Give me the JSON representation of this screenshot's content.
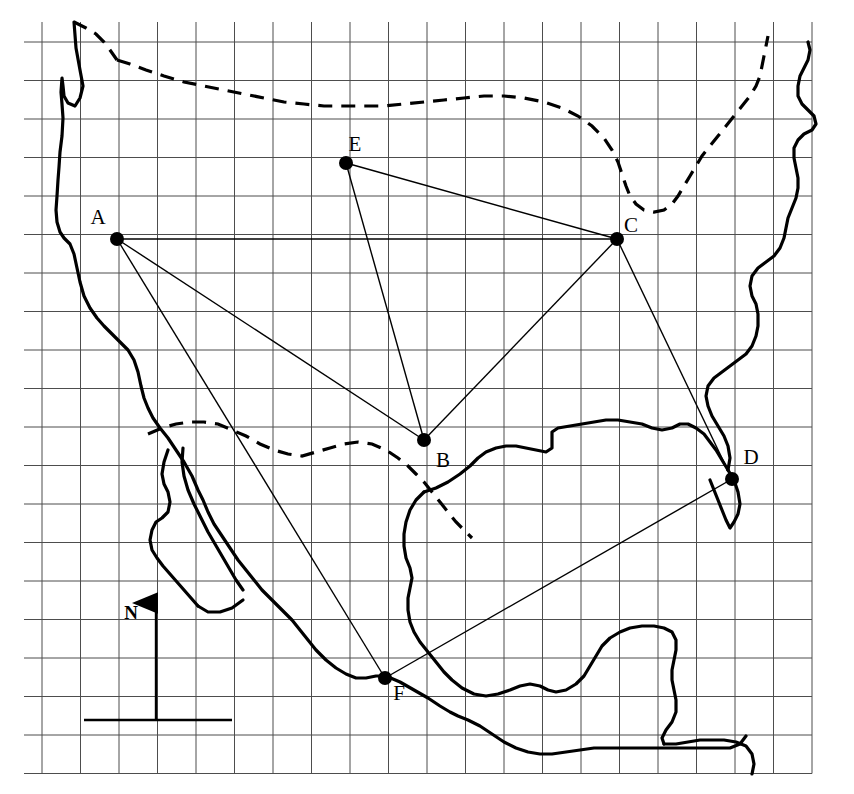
{
  "figure": {
    "kind": "reference-map",
    "title_partial": "",
    "width": 854,
    "height": 794,
    "background_color": "#ffffff",
    "ink_color": "#000000",
    "grid_color": "#555555"
  },
  "grid": {
    "label": "graticule",
    "x_start": 42,
    "y_start": 42,
    "spacing": 38.5,
    "cols": 20,
    "rows": 19,
    "line_color": "#4d4d4d",
    "line_width": 1
  },
  "coastline": {
    "name": "north-america-coastline",
    "style": "solid",
    "stroke_width": 3.2,
    "features": [
      "pacific-west-coast",
      "baja-california",
      "gulf-of-mexico",
      "yucatan-peninsula",
      "central-america",
      "florida-atlantic-coast",
      "northeast-atlantic-coast"
    ]
  },
  "borders": {
    "name": "political-borders",
    "style": "dashed",
    "stroke_width": 3.2,
    "dash_pattern": "14 9",
    "features": [
      "usa-canada-border-north",
      "usa-canada-border-east",
      "usa-mexico-border"
    ]
  },
  "points": [
    {
      "id": "A",
      "label": "A",
      "x": 117,
      "y": 239,
      "label_x": 98,
      "label_y": 224,
      "radius": 7
    },
    {
      "id": "B",
      "label": "B",
      "x": 424,
      "y": 440,
      "label_x": 443,
      "label_y": 467,
      "radius": 7
    },
    {
      "id": "C",
      "label": "C",
      "x": 617,
      "y": 239,
      "label_x": 631,
      "label_y": 232,
      "radius": 7
    },
    {
      "id": "D",
      "label": "D",
      "x": 732,
      "y": 479,
      "label_x": 751,
      "label_y": 464,
      "radius": 7
    },
    {
      "id": "E",
      "label": "E",
      "x": 346,
      "y": 163,
      "label_x": 355,
      "label_y": 151,
      "radius": 7
    },
    {
      "id": "F",
      "label": "F",
      "x": 385,
      "y": 678,
      "label_x": 399,
      "label_y": 700,
      "radius": 7
    }
  ],
  "connections": [
    {
      "id": "A-B",
      "from": "A",
      "to": "B"
    },
    {
      "id": "A-C",
      "from": "A",
      "to": "C"
    },
    {
      "id": "A-F",
      "from": "A",
      "to": "F"
    },
    {
      "id": "B-C",
      "from": "B",
      "to": "C"
    },
    {
      "id": "B-E",
      "from": "B",
      "to": "E"
    },
    {
      "id": "C-E",
      "from": "C",
      "to": "E"
    },
    {
      "id": "C-D",
      "from": "C",
      "to": "D"
    },
    {
      "id": "D-F",
      "from": "D",
      "to": "F"
    }
  ],
  "compass": {
    "name": "north-arrow",
    "label": "N",
    "label_x": 131,
    "label_y": 619,
    "shaft_x": 156,
    "shaft_top": 603,
    "shaft_bottom": 720,
    "baseline_x1": 84,
    "baseline_x2": 232,
    "baseline_y": 720
  },
  "paths": {
    "west_coast": "M 74 22 L 76 48 L 80 70 L 83 86 L 80 98 L 75 106 L 68 103 L 64 96 L 63 86 L 62 78 L 61 92 L 62 104 L 63 118 L 62 136 L 60 152 L 59 167 L 58 180 L 57 196 L 56 210 L 57 222 L 60 232 L 64 238 L 70 244 L 74 254 L 77 268 L 80 282 L 84 296 L 90 308 L 97 318 L 104 326 L 112 334 L 120 342 L 128 350 L 134 360 L 138 372 L 141 386 L 144 398 L 148 408 L 153 418 L 160 428 L 168 438 L 176 450 L 184 462 L 192 476 L 198 490 L 203 500 L 208 512 L 214 524 L 222 536 L 230 548 L 238 560 L 246 570 L 254 580 L 262 590 L 272 600 L 282 610 L 292 620 L 300 630 L 308 640 L 316 650 L 326 660 L 336 668 L 346 674 L 356 678 L 366 678 L 376 676 L 386 676",
    "baja_outer": "M 168 450 L 164 462 L 162 474 L 164 484 L 168 492 L 170 502 L 168 512 L 162 518 L 156 522 L 152 530 L 150 540 L 152 550 L 157 558 L 163 566 L 170 574 L 177 582 L 184 590 L 191 598 L 198 606",
    "baja_inner": "M 183 448 L 182 462 L 184 476 L 188 490 L 194 504 L 201 518 L 208 532 L 215 544 L 222 556 L 229 568 L 236 580 L 243 590",
    "baja_tip": "M 198 606 L 208 612 L 220 612 L 232 608 L 243 600",
    "mexico_south": "M 386 676 L 400 682 L 414 690 L 428 698 L 440 706 L 450 712 L 458 716 L 468 720 L 480 726 L 492 734 L 504 742 L 516 748 L 528 752 L 540 754 L 552 754 L 566 752 L 580 750 L 594 748 L 608 748 L 622 748 L 636 748 L 650 748 L 664 748 L 678 748 L 692 748 L 706 748 L 718 748 L 730 748 L 740 744 L 746 736",
    "gulf_coast": "M 424 492 L 436 488 L 448 482 L 460 474 L 470 466 L 478 458 L 486 452 L 496 448 L 506 446 L 516 446 L 526 448 L 536 450 L 546 452 L 552 448 L 552 440 L 552 432 L 558 428 L 570 426 L 582 424 L 594 422 L 606 420 L 618 420 L 630 422 L 642 424 L 652 428 L 662 430 L 672 428 L 680 424 L 688 424 L 696 428 L 704 434 L 710 442 L 716 450 L 722 460 L 728 470",
    "gulf_coast_west": "M 424 492 L 416 500 L 410 510 L 406 522 L 404 534 L 404 546 L 406 558 L 410 568 L 412 578 L 410 588 L 408 598 L 408 610 L 410 622 L 414 632 L 420 642 L 428 652 L 436 662 L 444 672 L 452 680 L 462 688 L 474 694 L 486 696 L 498 694 L 510 690 L 520 686 L 530 684 L 540 686 L 548 690 L 556 692 L 566 690 L 576 684 L 584 676 L 590 666 L 596 656 L 602 646 L 610 638 L 620 632 L 630 628 L 642 626 L 654 626 L 664 628 L 672 632 L 676 640 L 676 650 L 674 660 L 672 670 L 672 680 L 674 690 L 676 700 L 676 712 L 672 722 L 666 730 L 662 738 L 664 744",
    "yucatan": "M 664 744 L 676 744 L 688 742 L 700 740 L 712 740 L 724 740 L 736 742 L 746 746 L 752 754 L 754 764 L 752 774",
    "florida": "M 728 470 L 734 480 L 738 492 L 740 504 L 738 514 L 734 522 L 730 528 L 726 520 L 722 510 L 718 500 L 714 490 L 710 480",
    "east_coast": "M 728 470 L 730 458 L 728 446 L 724 436 L 718 426 L 712 416 L 708 406 L 706 396 L 708 386 L 714 378 L 722 372 L 730 366 L 738 360 L 746 354 L 752 346 L 756 336 L 758 326 L 758 314 L 756 304 L 752 296 L 750 286 L 752 276 L 758 268 L 766 262 L 774 256 L 780 248 L 784 238 L 786 228 L 788 218 L 792 208 L 796 198 L 798 188 L 798 178 L 796 168 L 794 158 L 794 148 L 798 140 L 804 134 L 812 130 L 816 124 L 814 116 L 808 110 L 802 104 L 798 96 L 798 86 L 800 76 L 804 68 L 808 60 L 810 50 L 808 42",
    "border_north": "M 117 60 L 130 64 L 146 70 L 164 76 L 184 82 L 204 86 L 224 90 L 244 94 L 264 98 L 284 102 L 304 104 L 324 106 L 344 106 L 364 106 L 384 106 L 404 104 L 424 102 L 444 100 L 464 98 L 484 96 L 504 96 L 524 98 L 544 102 L 562 108 L 578 116 L 592 126 L 604 138 L 612 150 L 618 162 L 622 174 L 626 186 L 630 196 L 636 204 L 644 210 L 654 212 L 664 210 L 672 204 L 678 196 L 684 186 L 690 176 L 696 166 L 702 156 L 710 146 L 718 136 L 726 126 L 734 116 L 742 106 L 750 96 L 756 86 L 760 76 L 762 66 L 764 56 L 766 46 L 768 36",
    "border_west_cap": "M 74 22 L 86 28 L 96 34 L 104 42 L 110 50 L 117 60",
    "border_mexico": "M 148 434 L 162 428 L 176 424 L 190 422 L 204 422 L 218 424 L 232 430 L 246 436 L 260 444 L 274 450 L 288 454 L 302 456 L 316 452 L 330 448 L 344 444 L 358 442 L 372 444 L 386 450 L 398 458 L 408 466 L 416 474 L 424 482 L 432 492 L 440 502 L 448 512 L 456 522 L 464 530 L 472 538"
  }
}
